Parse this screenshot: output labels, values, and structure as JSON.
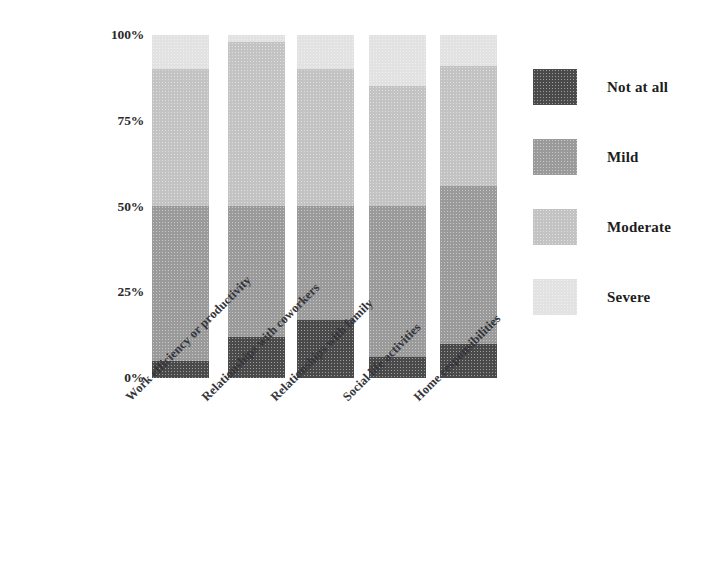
{
  "chart_data": {
    "type": "bar",
    "subtype": "100% stacked column",
    "title": "",
    "xlabel": "",
    "ylabel": "",
    "ylim": [
      0,
      100
    ],
    "yticks": [
      "0%",
      "25%",
      "50%",
      "75%",
      "100%"
    ],
    "ytick_values": [
      0,
      25,
      50,
      75,
      100
    ],
    "grid": false,
    "legend_position": "right",
    "categories": [
      "Work efficiency or productivity",
      "Relationships with coworkers",
      "Relationships with family",
      "Social life activities",
      "Home responsibilities"
    ],
    "series": [
      {
        "name": "Not at all",
        "color": "#4a4a4a",
        "values": [
          5,
          12,
          17,
          6,
          10
        ]
      },
      {
        "name": "Mild",
        "color": "#9a9a9a",
        "values": [
          45,
          38,
          33,
          44,
          46
        ]
      },
      {
        "name": "Moderate",
        "color": "#c3c3c3",
        "values": [
          40,
          48,
          40,
          35,
          35
        ]
      },
      {
        "name": "Severe",
        "color": "#e2e2e2",
        "values": [
          10,
          2,
          10,
          15,
          9
        ]
      }
    ]
  },
  "axis": {
    "yticks": [
      {
        "label": "100%",
        "value": 100
      },
      {
        "label": "75%",
        "value": 75
      },
      {
        "label": "50%",
        "value": 50
      },
      {
        "label": "25%",
        "value": 25
      },
      {
        "label": "0%",
        "value": 0
      }
    ]
  },
  "legend": {
    "items": [
      {
        "label": "Not at all",
        "color": "#4a4a4a"
      },
      {
        "label": "Mild",
        "color": "#9a9a9a"
      },
      {
        "label": "Moderate",
        "color": "#c3c3c3"
      },
      {
        "label": "Severe",
        "color": "#e2e2e2"
      }
    ]
  }
}
